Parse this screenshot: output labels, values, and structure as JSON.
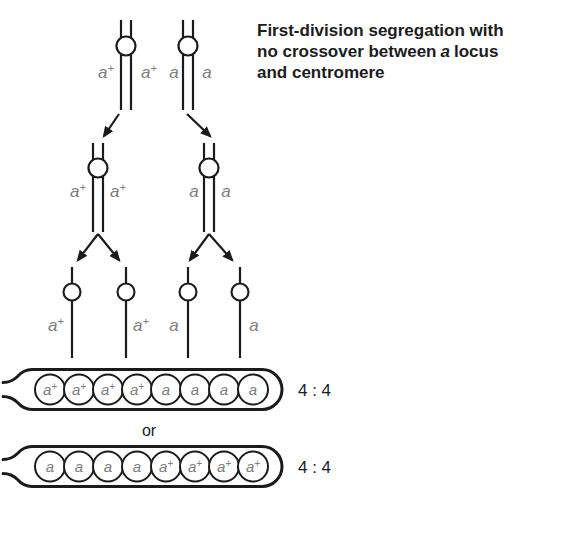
{
  "title": {
    "line1": "First-division segregation with",
    "line2_before": "no crossover between",
    "line2_italic": "a",
    "line2_after": "locus",
    "line3": "and centromere"
  },
  "tetrad": {
    "labels": [
      {
        "base": "a",
        "sup": "+"
      },
      {
        "base": "a",
        "sup": "+"
      },
      {
        "base": "a",
        "sup": ""
      },
      {
        "base": "a",
        "sup": ""
      }
    ]
  },
  "dyads": {
    "labels": [
      {
        "base": "a",
        "sup": "+"
      },
      {
        "base": "a",
        "sup": "+"
      },
      {
        "base": "a",
        "sup": ""
      },
      {
        "base": "a",
        "sup": ""
      }
    ]
  },
  "monads": {
    "labels": [
      {
        "base": "a",
        "sup": "+"
      },
      {
        "base": "a",
        "sup": "+"
      },
      {
        "base": "a",
        "sup": ""
      },
      {
        "base": "a",
        "sup": ""
      }
    ]
  },
  "or_label": "or",
  "asci": [
    {
      "cells": [
        {
          "base": "a",
          "sup": "+"
        },
        {
          "base": "a",
          "sup": "+"
        },
        {
          "base": "a",
          "sup": "+"
        },
        {
          "base": "a",
          "sup": "+"
        },
        {
          "base": "a",
          "sup": ""
        },
        {
          "base": "a",
          "sup": ""
        },
        {
          "base": "a",
          "sup": ""
        },
        {
          "base": "a",
          "sup": ""
        }
      ],
      "ratio": "4 : 4"
    },
    {
      "cells": [
        {
          "base": "a",
          "sup": ""
        },
        {
          "base": "a",
          "sup": ""
        },
        {
          "base": "a",
          "sup": ""
        },
        {
          "base": "a",
          "sup": ""
        },
        {
          "base": "a",
          "sup": "+"
        },
        {
          "base": "a",
          "sup": "+"
        },
        {
          "base": "a",
          "sup": "+"
        },
        {
          "base": "a",
          "sup": "+"
        }
      ],
      "ratio": "4 : 4"
    }
  ],
  "colors": {
    "line": "#1b1b1b",
    "allele_label": "#7d7d7d",
    "text": "#1c1c1c",
    "background": "#ffffff"
  }
}
